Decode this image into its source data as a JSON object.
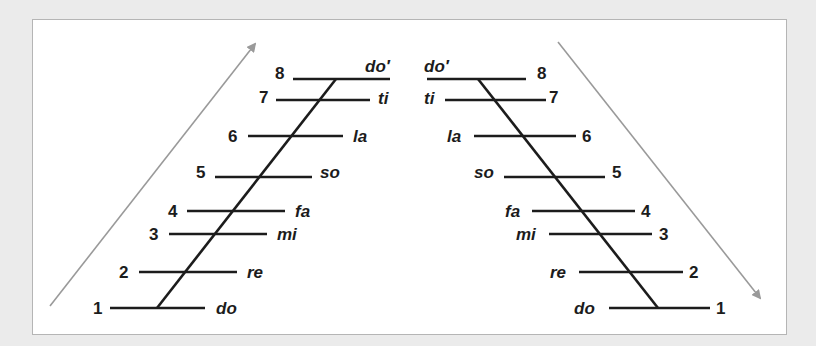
{
  "diagram": {
    "colors": {
      "background": "#ebebeb",
      "panel": "#ffffff",
      "lines": "#1c1c1c",
      "arrows": "#9a9a9a"
    },
    "ascending": {
      "direction": "up",
      "steps": [
        {
          "degree": "1",
          "syllable": "do"
        },
        {
          "degree": "2",
          "syllable": "re"
        },
        {
          "degree": "3",
          "syllable": "mi"
        },
        {
          "degree": "4",
          "syllable": "fa"
        },
        {
          "degree": "5",
          "syllable": "so"
        },
        {
          "degree": "6",
          "syllable": "la"
        },
        {
          "degree": "7",
          "syllable": "ti"
        },
        {
          "degree": "8",
          "syllable": "do′"
        }
      ]
    },
    "descending": {
      "direction": "down",
      "steps": [
        {
          "degree": "8",
          "syllable": "do′"
        },
        {
          "degree": "7",
          "syllable": "ti"
        },
        {
          "degree": "6",
          "syllable": "la"
        },
        {
          "degree": "5",
          "syllable": "so"
        },
        {
          "degree": "4",
          "syllable": "fa"
        },
        {
          "degree": "3",
          "syllable": "mi"
        },
        {
          "degree": "2",
          "syllable": "re"
        },
        {
          "degree": "1",
          "syllable": "do"
        }
      ]
    }
  }
}
